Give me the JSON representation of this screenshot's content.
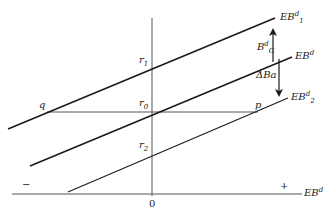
{
  "diagram": {
    "axes": {
      "x_label_base": "EB",
      "x_label_sup": "d",
      "origin": "0",
      "minus": "−",
      "plus": "+"
    },
    "lines": [
      {
        "id": "EB1",
        "label_base": "EB",
        "label_sup": "d",
        "label_sub": "1",
        "x1": 8,
        "y1": 129,
        "x2": 275,
        "y2": 18
      },
      {
        "id": "EB",
        "label_base": "EB",
        "label_sup": "d",
        "label_sub": "",
        "x1": 30,
        "y1": 166,
        "x2": 292,
        "y2": 57
      },
      {
        "id": "EB2",
        "label_base": "EB",
        "label_sup": "d",
        "label_sub": "2",
        "x1": 68,
        "y1": 192,
        "x2": 288,
        "y2": 98
      }
    ],
    "points": {
      "r1": {
        "base": "r",
        "sub": "1"
      },
      "r0": {
        "base": "r",
        "sub": "0"
      },
      "r2": {
        "base": "r",
        "sub": "2"
      },
      "q": "q",
      "p": "p"
    },
    "arrows": {
      "up_label_base": "B",
      "up_label_sup": "d",
      "up_label_sub": "G",
      "down_label": "ΔBa"
    },
    "colors": {
      "line": "#1a1a1a",
      "axis": "#444444",
      "background": "#ffffff"
    }
  }
}
